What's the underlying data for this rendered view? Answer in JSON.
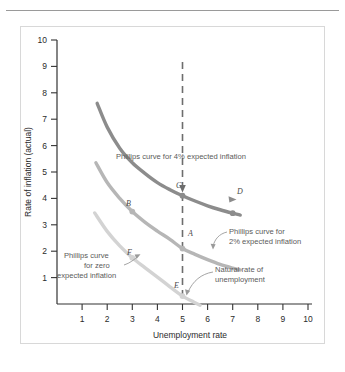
{
  "chart_data": {
    "type": "line",
    "title": "",
    "xlabel": "Unemployment rate",
    "ylabel": "Rate of inflation (actual)",
    "xlim": [
      0,
      10
    ],
    "ylim": [
      0,
      10
    ],
    "xticks": [
      "1",
      "2",
      "3",
      "4",
      "5",
      "6",
      "7",
      "8",
      "9",
      "10"
    ],
    "yticks": [
      "1",
      "2",
      "3",
      "4",
      "5",
      "6",
      "7",
      "8",
      "9",
      "10"
    ],
    "grid": false,
    "legend_position": "inline-annotations",
    "series": [
      {
        "name": "Phillips curve for 4% expected inflation",
        "color": "#8c8c8c",
        "x": [
          1.6,
          2.0,
          2.5,
          3.0,
          3.5,
          4.0,
          4.5,
          5.0,
          5.5,
          6.0,
          6.5,
          7.0,
          7.3
        ],
        "y": [
          7.6,
          6.7,
          5.9,
          5.35,
          4.95,
          4.6,
          4.33,
          4.1,
          3.9,
          3.72,
          3.57,
          3.44,
          3.37
        ]
      },
      {
        "name": "Phillips curve for 2% expected inflation",
        "color": "#b6b6b6",
        "x": [
          1.55,
          2.0,
          2.5,
          3.0,
          3.5,
          4.0,
          4.5,
          5.0,
          5.5,
          6.0,
          6.5,
          7.0,
          7.3
        ],
        "y": [
          5.35,
          4.6,
          4.0,
          3.5,
          3.1,
          2.76,
          2.45,
          2.1,
          1.88,
          1.68,
          1.5,
          1.36,
          1.29
        ]
      },
      {
        "name": "Phillips curve for zero expected inflation",
        "color": "#d3d3d3",
        "x": [
          1.5,
          2.0,
          2.5,
          3.0,
          3.5,
          4.0,
          4.5,
          5.0,
          5.4,
          5.7
        ],
        "y": [
          3.45,
          2.75,
          2.2,
          1.75,
          1.38,
          1.02,
          0.65,
          0.3,
          0.1,
          -0.05
        ]
      }
    ],
    "vertical_line": {
      "name": "Natural rate of unemployment",
      "x": 5,
      "style": "dashed",
      "color": "#6d6d6d"
    },
    "points": [
      {
        "label": "A",
        "x": 5,
        "y": 2.1,
        "series": "Phillips curve for 2% expected inflation"
      },
      {
        "label": "B",
        "x": 3,
        "y": 3.5,
        "series": "Phillips curve for 2% expected inflation"
      },
      {
        "label": "C",
        "x": 5,
        "y": 4.1,
        "series": "Phillips curve for 4% expected inflation"
      },
      {
        "label": "D",
        "x": 7,
        "y": 3.44,
        "series": "Phillips curve for 4% expected inflation"
      },
      {
        "label": "E",
        "x": 5,
        "y": 0.3,
        "series": "Phillips curve for zero expected inflation"
      },
      {
        "label": "F",
        "x": 3,
        "y": 1.75,
        "series": "Phillips curve for zero expected inflation"
      }
    ],
    "annotations": [
      {
        "id": "ann-4pct",
        "text": "Phillips curve for 4% expected inflation"
      },
      {
        "id": "ann-2pct-line1",
        "text": "Phillips curve for"
      },
      {
        "id": "ann-2pct-line2",
        "text": "2% expected inflation"
      },
      {
        "id": "ann-zero-line1",
        "text": "Phillips curve"
      },
      {
        "id": "ann-zero-line2",
        "text": "for zero"
      },
      {
        "id": "ann-zero-line3",
        "text": "expected inflation"
      },
      {
        "id": "ann-natural-line1",
        "text": "Natural rate of"
      },
      {
        "id": "ann-natural-line2",
        "text": "unemployment"
      }
    ]
  }
}
